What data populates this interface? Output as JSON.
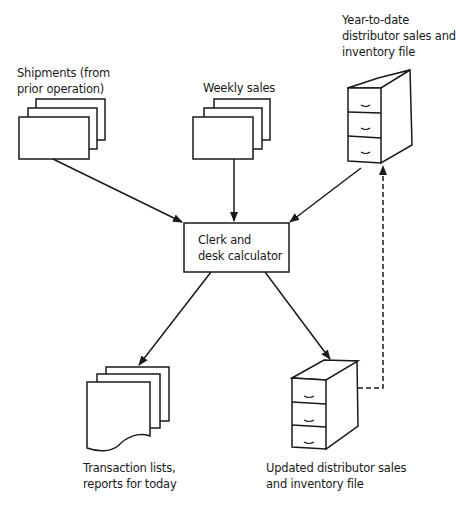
{
  "nodes": {
    "shipments": {
      "lines": [
        "Shipments (from",
        "prior operation)"
      ],
      "shape": "document-stack"
    },
    "weekly_sales": {
      "lines": [
        "Weekly sales"
      ],
      "shape": "document-stack"
    },
    "ytd_file": {
      "lines": [
        "Year-to-date",
        "distributor sales and",
        "inventory file"
      ],
      "shape": "file-cabinet"
    },
    "clerk": {
      "lines": [
        "Clerk and",
        "desk calculator"
      ],
      "shape": "process-box"
    },
    "transaction_lists": {
      "lines": [
        "Transaction lists,",
        "reports for today"
      ],
      "shape": "torn-document-stack"
    },
    "updated_file": {
      "lines": [
        "Updated distributor sales",
        "and inventory file"
      ],
      "shape": "file-cabinet"
    }
  },
  "edges": [
    {
      "from": "shipments",
      "to": "clerk",
      "style": "solid"
    },
    {
      "from": "weekly_sales",
      "to": "clerk",
      "style": "solid"
    },
    {
      "from": "ytd_file",
      "to": "clerk",
      "style": "solid"
    },
    {
      "from": "clerk",
      "to": "transaction_lists",
      "style": "solid"
    },
    {
      "from": "clerk",
      "to": "updated_file",
      "style": "solid"
    },
    {
      "from": "updated_file",
      "to": "ytd_file",
      "style": "dashed"
    }
  ],
  "colors": {
    "ink": "#1a1a1a",
    "background": "#ffffff"
  }
}
